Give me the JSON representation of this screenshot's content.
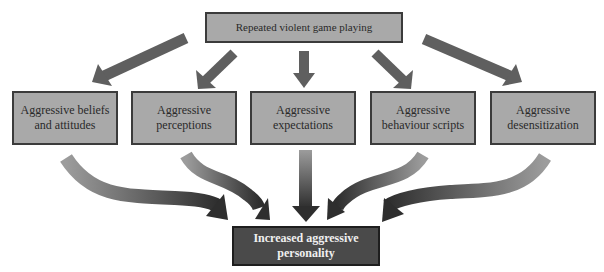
{
  "diagram": {
    "source": {
      "label": "Repeated violent game playing"
    },
    "mediators": [
      {
        "label": "Aggressive beliefs\nand attitudes"
      },
      {
        "label": "Aggressive\nperceptions"
      },
      {
        "label": "Aggressive\nexpectations"
      },
      {
        "label": "Aggressive\nbehaviour scripts"
      },
      {
        "label": "Aggressive\ndesensitization"
      }
    ],
    "outcome": {
      "label": "Increased aggressive\npersonality"
    },
    "colors": {
      "box_fill": "#a9a9a9",
      "box_border": "#3b3b3b",
      "outcome_fill": "#4a4a4a",
      "arrow_straight": "#5f5f5f",
      "arrow_gradient_start": "#9a9a9a",
      "arrow_gradient_end": "#2e2e2e"
    },
    "edges": [
      {
        "from": "source",
        "to": "mediators.0",
        "style": "straight"
      },
      {
        "from": "source",
        "to": "mediators.1",
        "style": "straight"
      },
      {
        "from": "source",
        "to": "mediators.2",
        "style": "straight"
      },
      {
        "from": "source",
        "to": "mediators.3",
        "style": "straight"
      },
      {
        "from": "source",
        "to": "mediators.4",
        "style": "straight"
      },
      {
        "from": "mediators.0",
        "to": "outcome",
        "style": "curved"
      },
      {
        "from": "mediators.1",
        "to": "outcome",
        "style": "curved"
      },
      {
        "from": "mediators.2",
        "to": "outcome",
        "style": "straight-gradient"
      },
      {
        "from": "mediators.3",
        "to": "outcome",
        "style": "curved"
      },
      {
        "from": "mediators.4",
        "to": "outcome",
        "style": "curved"
      }
    ]
  }
}
